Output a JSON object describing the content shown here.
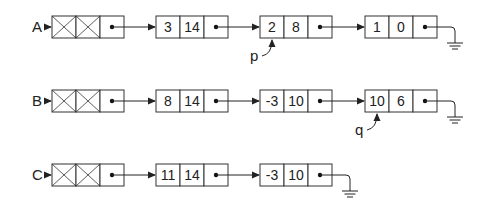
{
  "diagram": {
    "lists": [
      {
        "name": "A",
        "nodes": [
          {
            "coef": "3",
            "exp": "14"
          },
          {
            "coef": "2",
            "exp": "8"
          },
          {
            "coef": "1",
            "exp": "0"
          }
        ],
        "pointers": [
          {
            "label": "p",
            "target_node": 1
          }
        ]
      },
      {
        "name": "B",
        "nodes": [
          {
            "coef": "8",
            "exp": "14"
          },
          {
            "coef": "-3",
            "exp": "10"
          },
          {
            "coef": "10",
            "exp": "6"
          }
        ],
        "pointers": [
          {
            "label": "q",
            "target_node": 2
          }
        ]
      },
      {
        "name": "C",
        "nodes": [
          {
            "coef": "11",
            "exp": "14"
          },
          {
            "coef": "-3",
            "exp": "10"
          }
        ],
        "pointers": []
      }
    ],
    "head_node": "crossed-out header node",
    "terminator": "ground-symbol"
  }
}
